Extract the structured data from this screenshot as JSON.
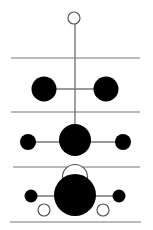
{
  "diagram": {
    "type": "energy-level-stack",
    "colors": {
      "line": "#777777",
      "filled": "#000000",
      "open_fill": "#ffffff",
      "open_stroke": "#555555",
      "background": "#ffffff"
    },
    "levels_y": [
      58,
      112,
      167,
      222
    ],
    "spine": {
      "x": 75,
      "y1": 24,
      "y2": 128
    },
    "nodes": [
      {
        "id": "top-open",
        "cx": 74,
        "cy": 18,
        "r": 6,
        "filled": false
      },
      {
        "id": "row2-left",
        "cx": 44,
        "cy": 89,
        "r": 12,
        "filled": true
      },
      {
        "id": "row2-right",
        "cx": 106,
        "cy": 89,
        "r": 12,
        "filled": true
      },
      {
        "id": "row3-left",
        "cx": 28,
        "cy": 142,
        "r": 8,
        "filled": true
      },
      {
        "id": "row3-center",
        "cx": 75,
        "cy": 140,
        "r": 16,
        "filled": true
      },
      {
        "id": "row3-right",
        "cx": 123,
        "cy": 142,
        "r": 8,
        "filled": true
      },
      {
        "id": "row4-arc",
        "cx": 75,
        "cy": 177,
        "r": 12,
        "filled": false
      },
      {
        "id": "row4-left",
        "cx": 31,
        "cy": 196,
        "r": 6.5,
        "filled": true
      },
      {
        "id": "row4-center",
        "cx": 75,
        "cy": 195,
        "r": 21,
        "filled": true
      },
      {
        "id": "row4-right",
        "cx": 119,
        "cy": 196,
        "r": 6.5,
        "filled": true
      },
      {
        "id": "row4-open-left",
        "cx": 44,
        "cy": 210,
        "r": 6,
        "filled": false
      },
      {
        "id": "row4-open-right",
        "cx": 103,
        "cy": 210,
        "r": 6,
        "filled": false
      }
    ]
  }
}
